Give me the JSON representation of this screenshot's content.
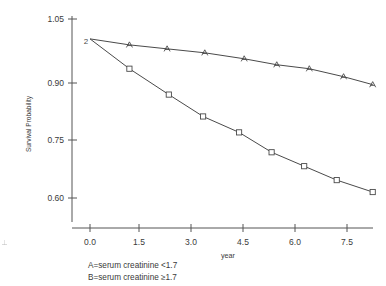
{
  "chart_data": {
    "type": "line",
    "title": "",
    "xlabel": "year",
    "ylabel": "Survival Probability",
    "xlim": [
      -0.2,
      8.6
    ],
    "ylim": [
      0.555,
      1.075
    ],
    "grid": false,
    "legend_position": "below-plot-left",
    "xticks": [
      "0.0",
      "1.5",
      "3.0",
      "4.5",
      "6.0",
      "7.5"
    ],
    "xtick_values": [
      0.0,
      1.5,
      3.0,
      4.5,
      6.0,
      7.5
    ],
    "yticks": [
      "1.05",
      "0.90",
      "0.75",
      "0.60"
    ],
    "ytick_values": [
      1.05,
      0.9,
      0.75,
      0.6
    ],
    "series": [
      {
        "name": "A",
        "marker": "A",
        "legend": "A=serum creatinine <1.7",
        "x": [
          0.0,
          1.15,
          2.25,
          3.35,
          4.5,
          5.45,
          6.4,
          7.4,
          8.25
        ],
        "values": [
          1.0,
          0.985,
          0.975,
          0.965,
          0.95,
          0.935,
          0.925,
          0.905,
          0.885
        ]
      },
      {
        "name": "B",
        "marker": "B",
        "legend": "B=serum creatinine ≥1.7",
        "x": [
          0.0,
          1.15,
          2.3,
          3.3,
          4.35,
          5.3,
          6.25,
          7.2,
          8.25
        ],
        "values": [
          1.0,
          0.925,
          0.86,
          0.805,
          0.765,
          0.715,
          0.68,
          0.645,
          0.615
        ]
      }
    ]
  },
  "axes": {
    "y_axis_title": "Survival Probability",
    "x_axis_title": "year"
  },
  "legend": {
    "line_a": "A=serum creatinine <1.7",
    "line_b": "B=serum creatinine ≥1.7"
  },
  "origin_marker": "2"
}
